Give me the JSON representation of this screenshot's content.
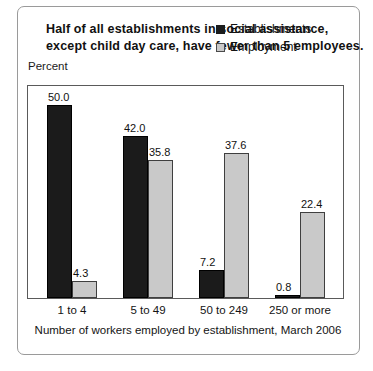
{
  "title": "Half of all establishments in social assistance, except child day care, have fewer than 5 employees.",
  "y_axis_label": "Percent",
  "x_axis_title": "Number of workers employed by establishment, March 2006",
  "legend": {
    "establishments_label": "Establishments",
    "employment_label": "Employment"
  },
  "colors": {
    "establishments": "#1b1b1b",
    "employment": "#c9c9c9",
    "border": "#5a5a5a",
    "text": "#111111"
  },
  "chart_data": {
    "type": "bar",
    "title": "Half of all establishments in social assistance, except child day care, have fewer than 5 employees.",
    "xlabel": "Number of workers employed by establishment, March 2006",
    "ylabel": "Percent",
    "ylim": [
      0,
      55
    ],
    "grid": false,
    "legend_position": "top-right",
    "categories": [
      "1 to 4",
      "5 to 49",
      "50 to 249",
      "250 or more"
    ],
    "series": [
      {
        "name": "Establishments",
        "color": "#1b1b1b",
        "values": [
          50.0,
          42.0,
          7.2,
          0.8
        ],
        "labels": [
          "50.0",
          "42.0",
          "7.2",
          "0.8"
        ]
      },
      {
        "name": "Employment",
        "color": "#c9c9c9",
        "values": [
          4.3,
          35.8,
          37.6,
          22.4
        ],
        "labels": [
          "4.3",
          "35.8",
          "37.6",
          "22.4"
        ]
      }
    ]
  }
}
